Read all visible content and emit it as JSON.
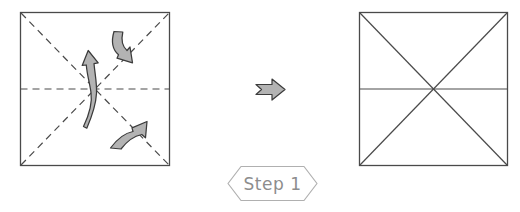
{
  "figure": {
    "background_color": "#ffffff",
    "line_color": "#4a4a4a",
    "arrow_fill": "#b3b3b3",
    "arrow_stroke": "#3b3b3b",
    "banner_stroke": "#b0b0b0",
    "banner_text_color": "#8d8d8d"
  },
  "before_panel": {
    "label": "paper before folding",
    "square": {
      "x": 20,
      "y": 12,
      "width": 150,
      "height": 154
    },
    "crease_style": "dashed",
    "creases": [
      {
        "name": "horizontal-midline-crease",
        "type": "dashed"
      },
      {
        "name": "diagonal-crease-tl-br",
        "type": "dashed"
      },
      {
        "name": "diagonal-crease-bl-tr",
        "type": "dashed"
      }
    ],
    "arrows": [
      {
        "name": "fold-arrow-up",
        "direction": "up"
      },
      {
        "name": "fold-arrow-upper-right",
        "direction": "down-right"
      },
      {
        "name": "fold-arrow-lower-right",
        "direction": "up-right"
      }
    ]
  },
  "transition": {
    "label": "leads to",
    "icon": "right-arrow-icon"
  },
  "after_panel": {
    "label": "paper after folding",
    "square": {
      "x": 359,
      "y": 12,
      "width": 149,
      "height": 154
    },
    "crease_style": "solid",
    "creases": [
      {
        "name": "horizontal-midline",
        "type": "solid"
      },
      {
        "name": "diagonal-tl-br",
        "type": "solid"
      },
      {
        "name": "diagonal-bl-tr",
        "type": "solid"
      }
    ]
  },
  "step_banner": {
    "text": "Step 1",
    "shape": "hexagon"
  }
}
